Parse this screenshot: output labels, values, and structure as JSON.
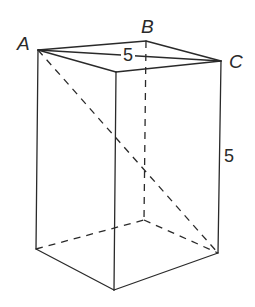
{
  "diagram": {
    "type": "rectangular prism with diagonals",
    "vertices": {
      "A": {
        "label": "A",
        "x": 38,
        "y": 50
      },
      "B": {
        "label": "B",
        "x": 146,
        "y": 41
      },
      "C": {
        "label": "C",
        "x": 221,
        "y": 61
      },
      "D": {
        "x": 116,
        "y": 72
      },
      "E": {
        "x": 36,
        "y": 249
      },
      "F": {
        "x": 114,
        "y": 290
      },
      "G": {
        "x": 218,
        "y": 253
      },
      "H": {
        "x": 144,
        "y": 220
      }
    },
    "labels": {
      "A": "A",
      "B": "B",
      "C": "C",
      "top_diagonal_length": "5",
      "height": "5"
    }
  }
}
